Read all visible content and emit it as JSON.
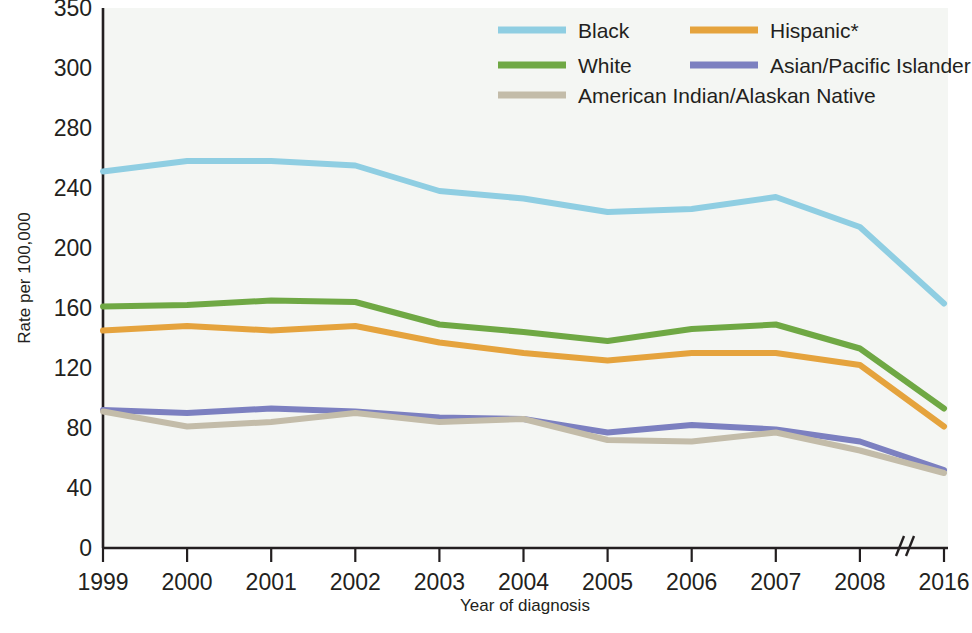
{
  "chart_data": {
    "type": "line",
    "title": "",
    "xlabel": "Year of diagnosis",
    "ylabel": "Rate per 100,000",
    "x": [
      "1999",
      "2000",
      "2001",
      "2002",
      "2003",
      "2004",
      "2005",
      "2006",
      "2007",
      "2008",
      "2016"
    ],
    "categories": [
      "1999",
      "2000",
      "2001",
      "2002",
      "2003",
      "2004",
      "2005",
      "2006",
      "2007",
      "2008",
      "2016"
    ],
    "ytick_labels": [
      "0",
      "40",
      "80",
      "120",
      "160",
      "200",
      "240",
      "280",
      "300",
      "350"
    ],
    "ytick_values": [
      0,
      40,
      80,
      120,
      160,
      200,
      240,
      280,
      300,
      350
    ],
    "ylim": [
      0,
      350
    ],
    "grid": false,
    "legend_position": "top-right",
    "axis_break": {
      "present": true,
      "glyph": "//",
      "between": [
        "2008",
        "2016"
      ]
    },
    "footnote_marker": "*",
    "series": [
      {
        "name": "Black",
        "color": "#8FCEE2",
        "values": [
          251,
          258,
          258,
          255,
          238,
          233,
          224,
          226,
          234,
          214,
          163
        ]
      },
      {
        "name": "White",
        "color": "#6FA844",
        "values": [
          161,
          162,
          165,
          164,
          149,
          144,
          138,
          146,
          149,
          133,
          93
        ]
      },
      {
        "name": "Hispanic*",
        "color": "#E5A33D",
        "values": [
          145,
          148,
          145,
          148,
          137,
          130,
          125,
          130,
          130,
          122,
          81
        ]
      },
      {
        "name": "Asian/Pacific Islander",
        "color": "#7C80C0",
        "values": [
          92,
          90,
          93,
          91,
          87,
          86,
          77,
          82,
          79,
          71,
          52
        ]
      },
      {
        "name": "American Indian/Alaskan Native",
        "color": "#C3BCA9",
        "values": [
          91,
          81,
          84,
          90,
          84,
          86,
          72,
          71,
          77,
          65,
          50
        ]
      }
    ]
  },
  "legend": {
    "entries": [
      {
        "label": "Black",
        "color": "#8FCEE2"
      },
      {
        "label": "Hispanic*",
        "color": "#E5A33D"
      },
      {
        "label": "White",
        "color": "#6FA844"
      },
      {
        "label": "Asian/Pacific Islander",
        "color": "#7C80C0"
      },
      {
        "label": "American Indian/Alaskan Native",
        "color": "#C3BCA9"
      }
    ]
  }
}
